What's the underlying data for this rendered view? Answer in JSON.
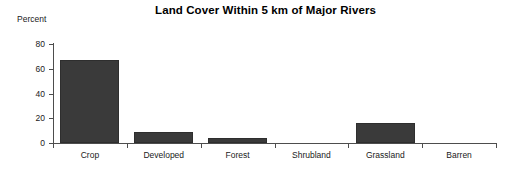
{
  "chart_data": {
    "type": "bar",
    "title": "Land Cover Within 5 km of Major Rivers",
    "xlabel": "",
    "ylabel": "Percent",
    "categories": [
      "Crop",
      "Developed",
      "Forest",
      "Shrubland",
      "Grassland",
      "Barren"
    ],
    "values": [
      67,
      9,
      4,
      0,
      16,
      0
    ],
    "ylim": [
      0,
      80
    ],
    "yticks": [
      0,
      20,
      40,
      60,
      80
    ],
    "ytick_labels": [
      "0",
      "20",
      "40",
      "60",
      "80"
    ],
    "grid": false,
    "legend": null,
    "series": [
      {
        "name": "Percent",
        "values": [
          67,
          9,
          4,
          0,
          16,
          0
        ]
      }
    ],
    "bar_color": "#3a3a3a",
    "axis_color": "#4d4d4d",
    "background_color": "#ffffff"
  }
}
